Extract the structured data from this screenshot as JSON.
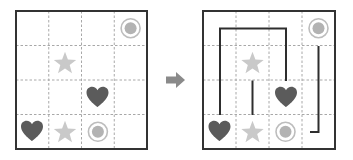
{
  "diagram": {
    "type": "grid-connect-puzzle",
    "grid_size": {
      "rows": 4,
      "cols": 4
    },
    "colors": {
      "frame": "#333333",
      "gridline": "#a8a8a8",
      "heart": "#5b5b5b",
      "star": "#c9c9c9",
      "circle_ring": "#bdbdbd",
      "circle_fill": "#b3b3b3",
      "path": "#2e2e2e",
      "arrow": "#8a8a8a",
      "background": "#ffffff"
    },
    "puzzle": {
      "label": "unsolved",
      "symbols": [
        {
          "type": "circle",
          "row": 0,
          "col": 3
        },
        {
          "type": "star",
          "row": 1,
          "col": 1
        },
        {
          "type": "heart",
          "row": 2,
          "col": 2
        },
        {
          "type": "heart",
          "row": 3,
          "col": 0
        },
        {
          "type": "star",
          "row": 3,
          "col": 1
        },
        {
          "type": "circle",
          "row": 3,
          "col": 2
        }
      ]
    },
    "arrow": {
      "direction": "right",
      "icon": "right-arrow"
    },
    "solution": {
      "label": "solved",
      "symbols": [
        {
          "type": "circle",
          "row": 0,
          "col": 3
        },
        {
          "type": "star",
          "row": 1,
          "col": 1
        },
        {
          "type": "heart",
          "row": 2,
          "col": 2
        },
        {
          "type": "heart",
          "row": 3,
          "col": 0
        },
        {
          "type": "star",
          "row": 3,
          "col": 1
        },
        {
          "type": "circle",
          "row": 3,
          "col": 2
        }
      ],
      "paths": [
        {
          "connects": "heart",
          "from": [
            3,
            0
          ],
          "to": [
            2,
            2
          ]
        },
        {
          "connects": "star",
          "from": [
            1,
            1
          ],
          "to": [
            3,
            1
          ]
        },
        {
          "connects": "circle",
          "from": [
            0,
            3
          ],
          "to": [
            3,
            2
          ]
        }
      ]
    }
  }
}
